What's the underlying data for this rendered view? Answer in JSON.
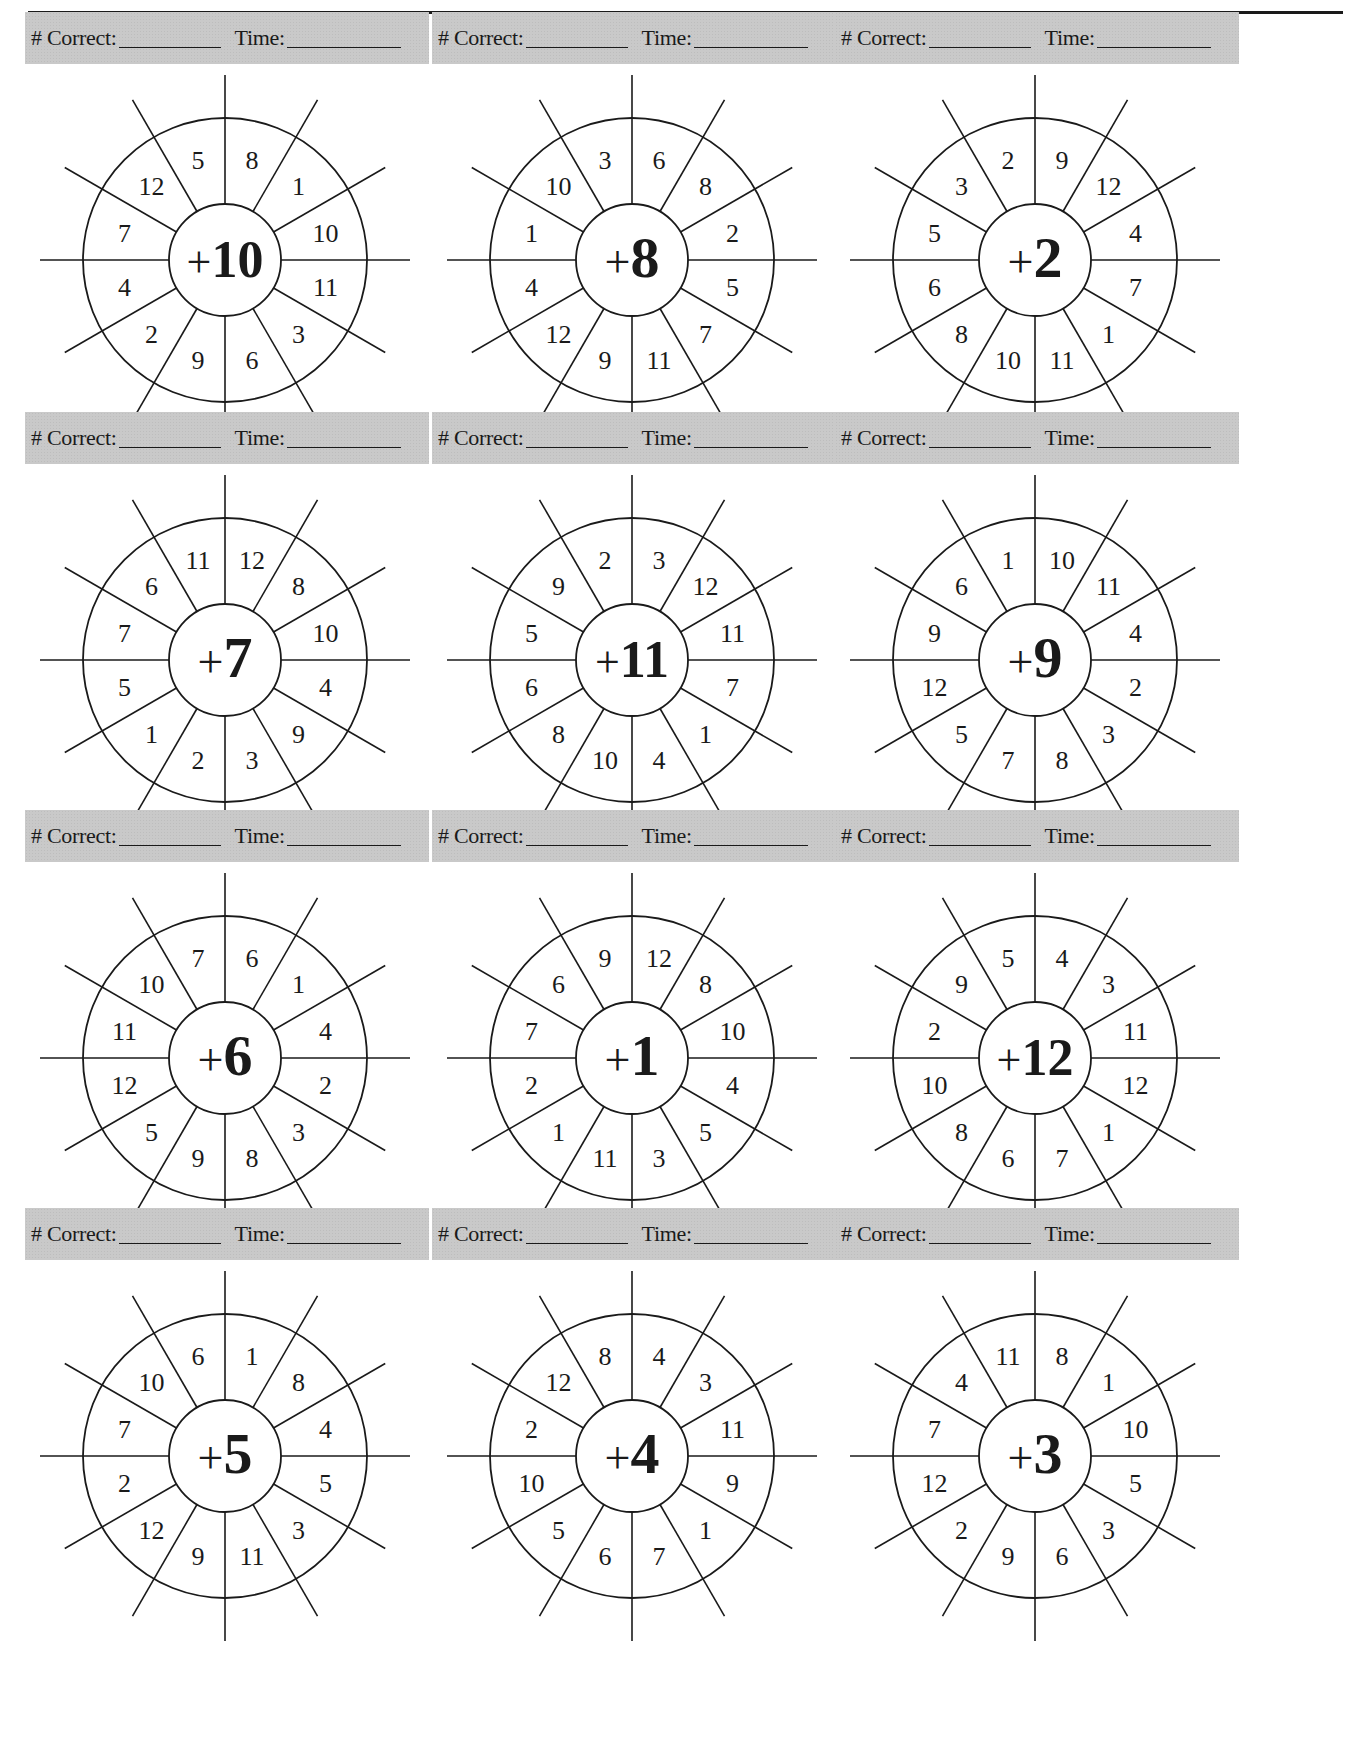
{
  "header": {
    "correct_label": "# Correct:",
    "time_label": "Time:"
  },
  "wheels": [
    {
      "plus": "+",
      "addend": "10",
      "numbers": [
        "8",
        "1",
        "10",
        "11",
        "3",
        "6",
        "9",
        "2",
        "4",
        "7",
        "12",
        "5"
      ]
    },
    {
      "plus": "+",
      "addend": "8",
      "numbers": [
        "6",
        "8",
        "2",
        "5",
        "7",
        "11",
        "9",
        "12",
        "4",
        "1",
        "10",
        "3"
      ]
    },
    {
      "plus": "+",
      "addend": "2",
      "numbers": [
        "9",
        "12",
        "4",
        "7",
        "1",
        "11",
        "10",
        "8",
        "6",
        "5",
        "3",
        "2"
      ]
    },
    {
      "plus": "+",
      "addend": "7",
      "numbers": [
        "12",
        "8",
        "10",
        "4",
        "9",
        "3",
        "2",
        "1",
        "5",
        "7",
        "6",
        "11"
      ]
    },
    {
      "plus": "+",
      "addend": "11",
      "numbers": [
        "3",
        "12",
        "11",
        "7",
        "1",
        "4",
        "10",
        "8",
        "6",
        "5",
        "9",
        "2"
      ]
    },
    {
      "plus": "+",
      "addend": "9",
      "numbers": [
        "10",
        "11",
        "4",
        "2",
        "3",
        "8",
        "7",
        "5",
        "12",
        "9",
        "6",
        "1"
      ]
    },
    {
      "plus": "+",
      "addend": "6",
      "numbers": [
        "6",
        "1",
        "4",
        "2",
        "3",
        "8",
        "9",
        "5",
        "12",
        "11",
        "10",
        "7"
      ]
    },
    {
      "plus": "+",
      "addend": "1",
      "numbers": [
        "12",
        "8",
        "10",
        "4",
        "5",
        "3",
        "11",
        "1",
        "2",
        "7",
        "6",
        "9"
      ]
    },
    {
      "plus": "+",
      "addend": "12",
      "numbers": [
        "4",
        "3",
        "11",
        "12",
        "1",
        "7",
        "6",
        "8",
        "10",
        "2",
        "9",
        "5"
      ]
    },
    {
      "plus": "+",
      "addend": "5",
      "numbers": [
        "1",
        "8",
        "4",
        "5",
        "3",
        "11",
        "9",
        "12",
        "2",
        "7",
        "10",
        "6"
      ]
    },
    {
      "plus": "+",
      "addend": "4",
      "numbers": [
        "4",
        "3",
        "11",
        "9",
        "1",
        "7",
        "6",
        "5",
        "10",
        "2",
        "12",
        "8"
      ]
    },
    {
      "plus": "+",
      "addend": "3",
      "numbers": [
        "8",
        "1",
        "10",
        "5",
        "3",
        "6",
        "9",
        "2",
        "12",
        "7",
        "4",
        "11"
      ]
    }
  ],
  "colors": {
    "header_band": "#c9c9c9",
    "ink": "#1a1a1a",
    "paper": "#ffffff"
  }
}
